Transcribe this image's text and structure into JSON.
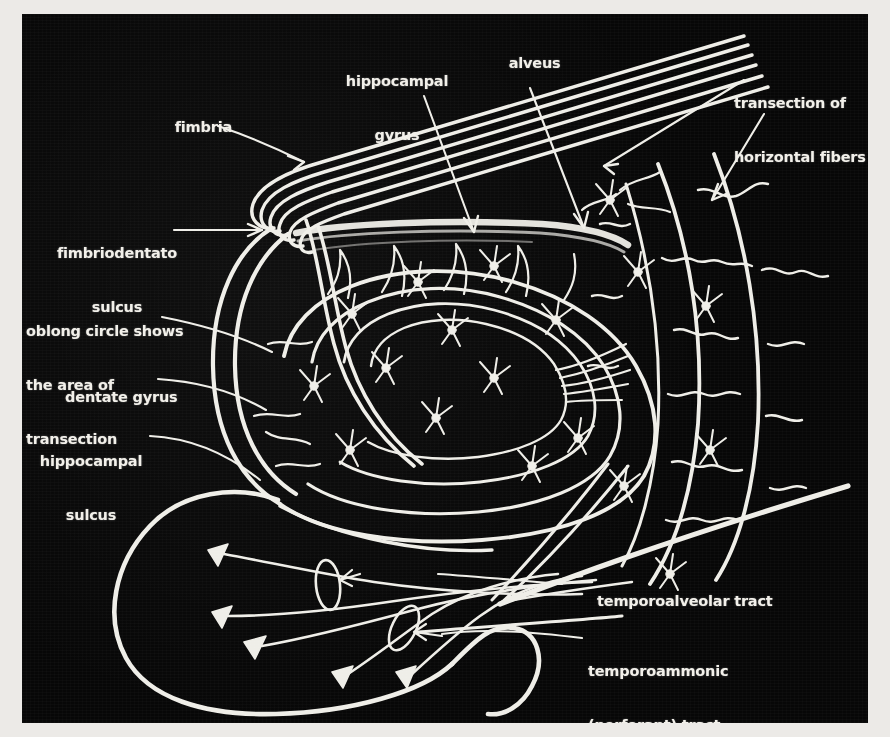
{
  "figure": {
    "background_color": "#070707",
    "ink_color": "#f2f0ea",
    "page_color": "#eceae7"
  },
  "labels": [
    {
      "id": "fimbria",
      "text": "fimbria",
      "lines": [
        "fimbria"
      ]
    },
    {
      "id": "hippocampal-gyrus",
      "text": "hippocampal gyrus",
      "lines": [
        "hippocampal",
        "gyrus"
      ]
    },
    {
      "id": "alveus",
      "text": "alveus",
      "lines": [
        "alveus"
      ]
    },
    {
      "id": "transection-horizontal",
      "text": "transection of horizontal fibers",
      "lines": [
        "transection of",
        "horizontal fibers"
      ]
    },
    {
      "id": "fimbriodentato-sulcus",
      "text": "fimbriodentato sulcus",
      "lines": [
        "fimbriodentato",
        "sulcus"
      ]
    },
    {
      "id": "oblong-circle",
      "text": "oblong circle shows the area of transection",
      "lines": [
        "oblong circle shows",
        "the area of",
        "transection"
      ]
    },
    {
      "id": "dentate-gyrus",
      "text": "dentate gyrus",
      "lines": [
        "dentate gyrus"
      ]
    },
    {
      "id": "hippocampal-sulcus",
      "text": "hippocampal sulcus",
      "lines": [
        "hippocampal",
        "sulcus"
      ]
    },
    {
      "id": "temporoalveolar-tract",
      "text": "temporoalveolar tract",
      "lines": [
        "temporoalveolar tract"
      ]
    },
    {
      "id": "temporoammonic-tract",
      "text": "temporoammonic (perforant) tract",
      "lines": [
        "temporoammonic",
        "(perforant) tract"
      ]
    }
  ],
  "label_text": {
    "fimbria": "fimbria",
    "hippocampal_gyrus_l1": "hippocampal",
    "hippocampal_gyrus_l2": "gyrus",
    "alveus": "alveus",
    "transection_l1": "transection of",
    "transection_l2": "horizontal fibers",
    "fimbriodentato_l1": "fimbriodentato",
    "fimbriodentato_l2": "sulcus",
    "oblong_l1": "oblong circle shows",
    "oblong_l2": "the area of",
    "oblong_l3": "transection",
    "dentate_gyrus": "dentate gyrus",
    "hippocampal_sulcus_l1": "hippocampal",
    "hippocampal_sulcus_l2": "sulcus",
    "temporoalveolar": "temporoalveolar tract",
    "temporoammonic_l1": "temporoammonic",
    "temporoammonic_l2": "(perforant) tract"
  },
  "structures": [
    {
      "name": "fimbria-fiber-bundle",
      "description": "bundle of six parallel fibers running up-right, hairpin-curved at the left"
    },
    {
      "name": "alveus-band",
      "description": "horizontal band beneath the fimbria bundle"
    },
    {
      "name": "dentate-gyrus-outline",
      "description": "large double-lined oval loop on the left"
    },
    {
      "name": "hippocampal-sulcus-curve",
      "description": "long curve hooking around the lower left lobe"
    },
    {
      "name": "concentric-arcs",
      "description": "nested oval arcs forming the cornu ammonis spiral"
    },
    {
      "name": "pyramidal-neurons",
      "description": "branching cells with dendritic trees scattered across the plate"
    },
    {
      "name": "cone-cell-bodies",
      "description": "five funnel-shaped cell bodies with long axons in the lower left"
    },
    {
      "name": "transection-ellipses",
      "description": "two small oblong circles marking areas of transection"
    },
    {
      "name": "temporoalveolar-line",
      "description": "thick straight tract ascending to the right"
    },
    {
      "name": "temporoammonic-line",
      "description": "straight tract running to the lower right"
    },
    {
      "name": "vertical-fiber-arcs",
      "description": "tall arcs on the right with wiggly branching collaterals"
    }
  ]
}
